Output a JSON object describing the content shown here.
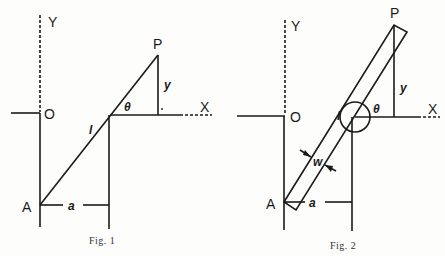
{
  "figures": [
    {
      "caption": "Fig. 1",
      "labels": {
        "Y": "Y",
        "O": "O",
        "X": "X",
        "P": "P",
        "A": "A",
        "y": "y",
        "theta": "θ",
        "l": "l",
        "a": "a"
      }
    },
    {
      "caption": "Fig. 2",
      "labels": {
        "Y": "Y",
        "O": "O",
        "X": "X",
        "P": "P",
        "A": "A",
        "y": "y",
        "theta": "θ",
        "l": "l",
        "a": "a",
        "w": "w"
      }
    }
  ]
}
